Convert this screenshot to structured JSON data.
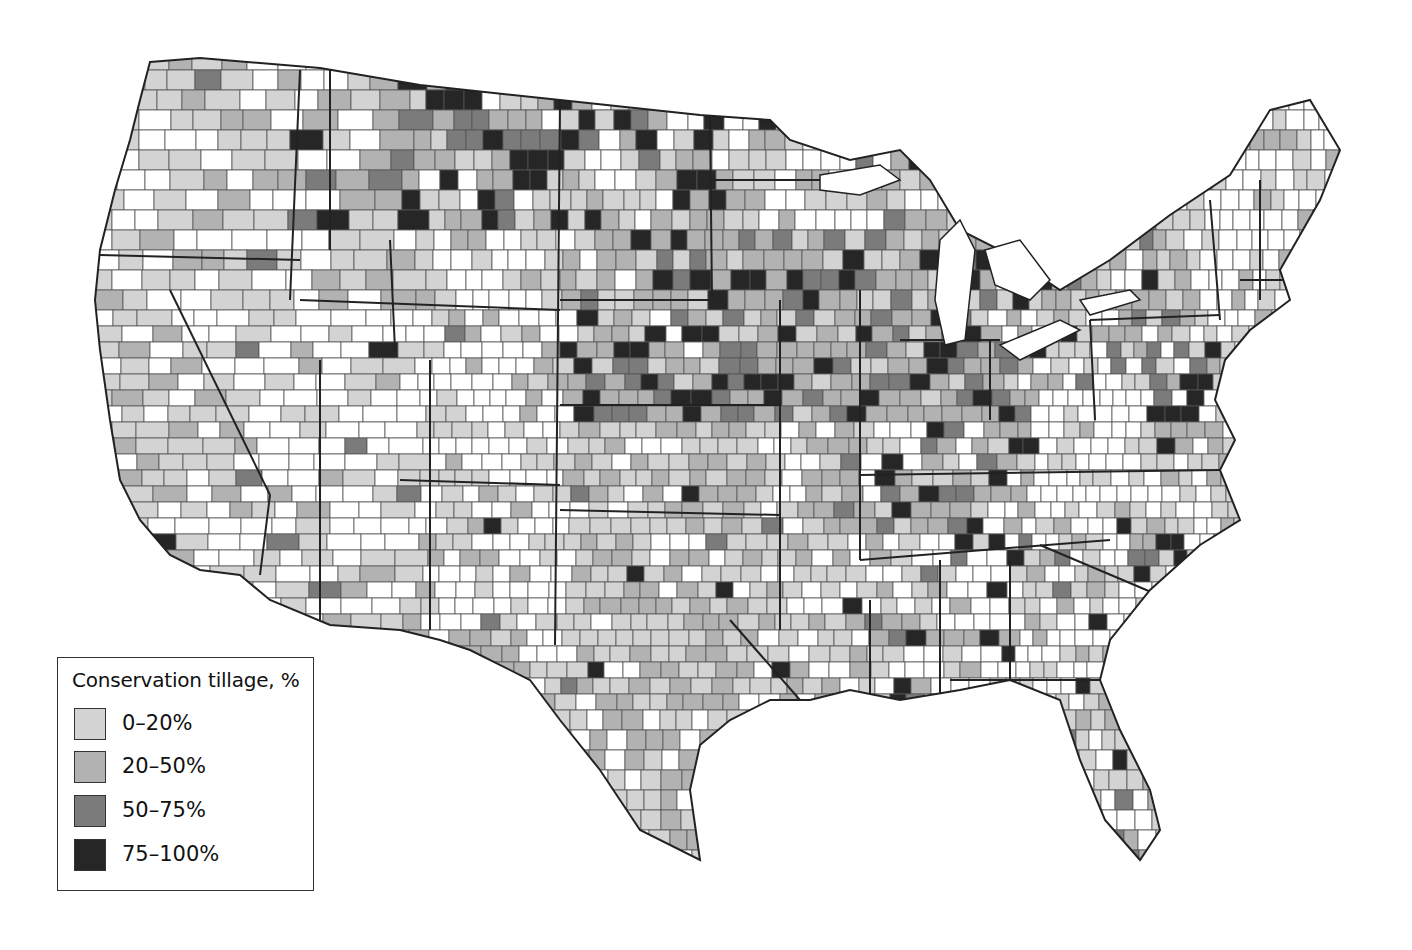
{
  "legend": {
    "title": "Conservation tillage, %",
    "items": [
      {
        "label": "0–20%",
        "color": "#d3d3d3"
      },
      {
        "label": "20–50%",
        "color": "#b2b2b2"
      },
      {
        "label": "50–75%",
        "color": "#7b7b7b"
      },
      {
        "label": "75–100%",
        "color": "#262626"
      }
    ],
    "no_data_color": "#ffffff"
  },
  "map": {
    "subject": "Conservation tillage by county, contiguous United States",
    "outline_color": "#222222",
    "county_line_color": "#555555",
    "high_adoption_regions": [
      "Northern Great Plains (Montana / North Dakota)",
      "Corn Belt (Iowa / Nebraska / Illinois)",
      "Kentucky / Tennessee",
      "Eastern Shore (Maryland / Delaware / Virginia)"
    ],
    "low_or_no_data_regions": [
      "Nevada",
      "Utah",
      "Arizona",
      "New Mexico",
      "Wyoming",
      "New England",
      "West Virginia"
    ]
  }
}
